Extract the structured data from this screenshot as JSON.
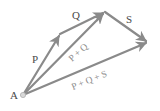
{
  "diagram": {
    "type": "vector-addition",
    "colors": {
      "vector": "#8a8a8a",
      "label_primary": "#4a4a4a",
      "label_result": "#8c8c8c",
      "origin_point": "#d8d8d8"
    },
    "origin": {
      "label": "A",
      "x": 23,
      "y": 95
    },
    "points": {
      "A": [
        23,
        95
      ],
      "P_end": [
        60,
        34
      ],
      "PQ_end": [
        105,
        12
      ],
      "PQS_end": [
        148,
        42
      ]
    },
    "vectors": [
      {
        "id": "P",
        "label": "P",
        "from": "A",
        "to": "P_end"
      },
      {
        "id": "Q",
        "label": "Q",
        "from": "P_end",
        "to": "PQ_end"
      },
      {
        "id": "S",
        "label": "S",
        "from": "PQ_end",
        "to": "PQS_end"
      },
      {
        "id": "PQ",
        "label": "P + Q",
        "from": "A",
        "to": "PQ_end"
      },
      {
        "id": "PQS",
        "label": "P + Q + S",
        "from": "A",
        "to": "PQS_end"
      }
    ],
    "labels": {
      "A": "A",
      "P": "P",
      "Q": "Q",
      "S": "S",
      "PQ": "P + Q",
      "PQS": "P + Q + S"
    }
  }
}
